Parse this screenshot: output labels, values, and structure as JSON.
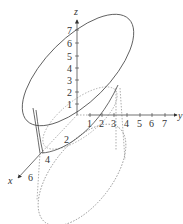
{
  "diagram": {
    "type": "3d-surface-sketch",
    "axes": {
      "x": {
        "label": "x",
        "ticks": [
          "2",
          "4",
          "6"
        ]
      },
      "y": {
        "label": "y",
        "ticks": [
          "1",
          "2",
          "3",
          "4",
          "5",
          "6",
          "7"
        ]
      },
      "z": {
        "label": "z",
        "ticks": [
          "1",
          "2",
          "3",
          "4",
          "5",
          "6",
          "7"
        ]
      }
    },
    "colors": {
      "stroke": "#444444",
      "dashed": "#777777"
    }
  }
}
